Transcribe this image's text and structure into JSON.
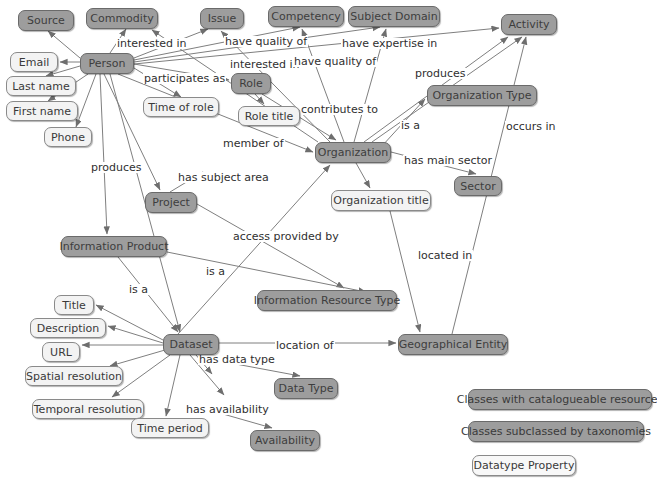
{
  "diagram": {
    "background_color": "#ffffff",
    "node_fill_dark": "#9d9d9d",
    "node_fill_light": "#f3f3f3",
    "edge_color": "#7a7a7a"
  },
  "nodes": [
    {
      "id": "source",
      "label": "Source",
      "style": "dark",
      "x": 18,
      "y": 10,
      "w": 56,
      "h": 21
    },
    {
      "id": "commodity",
      "label": "Commodity",
      "style": "dark",
      "x": 86,
      "y": 8,
      "w": 72,
      "h": 21
    },
    {
      "id": "issue",
      "label": "Issue",
      "style": "dark",
      "x": 200,
      "y": 8,
      "w": 44,
      "h": 21
    },
    {
      "id": "competency",
      "label": "Competency",
      "style": "dark",
      "x": 268,
      "y": 6,
      "w": 76,
      "h": 21
    },
    {
      "id": "subject_domain",
      "label": "Subject Domain",
      "style": "dark",
      "x": 348,
      "y": 6,
      "w": 92,
      "h": 21
    },
    {
      "id": "activity",
      "label": "Activity",
      "style": "dark",
      "x": 501,
      "y": 14,
      "w": 56,
      "h": 21
    },
    {
      "id": "email",
      "label": "Email",
      "style": "light",
      "x": 10,
      "y": 52,
      "w": 48,
      "h": 20
    },
    {
      "id": "person",
      "label": "Person",
      "style": "dark",
      "x": 80,
      "y": 53,
      "w": 54,
      "h": 21
    },
    {
      "id": "role",
      "label": "Role",
      "style": "dark",
      "x": 231,
      "y": 73,
      "w": 40,
      "h": 21
    },
    {
      "id": "last_name",
      "label": "Last name",
      "style": "light",
      "x": 6,
      "y": 76,
      "w": 70,
      "h": 20
    },
    {
      "id": "time_of_role",
      "label": "Time of role",
      "style": "light",
      "x": 143,
      "y": 97,
      "w": 76,
      "h": 20
    },
    {
      "id": "role_title",
      "label": "Role title",
      "style": "light",
      "x": 238,
      "y": 106,
      "w": 62,
      "h": 20
    },
    {
      "id": "org_type",
      "label": "Organization Type",
      "style": "dark",
      "x": 427,
      "y": 85,
      "w": 110,
      "h": 21
    },
    {
      "id": "first_name",
      "label": "First name",
      "style": "light",
      "x": 6,
      "y": 101,
      "w": 72,
      "h": 20
    },
    {
      "id": "phone",
      "label": "Phone",
      "style": "light",
      "x": 44,
      "y": 127,
      "w": 48,
      "h": 20
    },
    {
      "id": "organization",
      "label": "Organization",
      "style": "dark",
      "x": 315,
      "y": 142,
      "w": 76,
      "h": 21
    },
    {
      "id": "sector",
      "label": "Sector",
      "style": "dark",
      "x": 454,
      "y": 176,
      "w": 48,
      "h": 20
    },
    {
      "id": "project",
      "label": "Project",
      "style": "dark",
      "x": 145,
      "y": 192,
      "w": 52,
      "h": 21
    },
    {
      "id": "org_title",
      "label": "Organization title",
      "style": "light",
      "x": 331,
      "y": 190,
      "w": 100,
      "h": 21
    },
    {
      "id": "info_product",
      "label": "Information Product",
      "style": "dark",
      "x": 61,
      "y": 236,
      "w": 106,
      "h": 21
    },
    {
      "id": "info_res_type",
      "label": "Information Resource Type",
      "style": "dark",
      "x": 257,
      "y": 290,
      "w": 140,
      "h": 21
    },
    {
      "id": "title",
      "label": "Title",
      "style": "light",
      "x": 54,
      "y": 295,
      "w": 40,
      "h": 20
    },
    {
      "id": "description",
      "label": "Description",
      "style": "light",
      "x": 30,
      "y": 318,
      "w": 76,
      "h": 20
    },
    {
      "id": "dataset",
      "label": "Dataset",
      "style": "dark",
      "x": 163,
      "y": 334,
      "w": 56,
      "h": 21
    },
    {
      "id": "geo_entity",
      "label": "Geographical Entity",
      "style": "dark",
      "x": 398,
      "y": 334,
      "w": 110,
      "h": 21
    },
    {
      "id": "url",
      "label": "URL",
      "style": "light",
      "x": 42,
      "y": 342,
      "w": 38,
      "h": 20
    },
    {
      "id": "spatial_res",
      "label": "Spatial resolution",
      "style": "light",
      "x": 25,
      "y": 366,
      "w": 98,
      "h": 20
    },
    {
      "id": "data_type",
      "label": "Data Type",
      "style": "dark",
      "x": 274,
      "y": 378,
      "w": 64,
      "h": 21
    },
    {
      "id": "temporal_res",
      "label": "Temporal resolution",
      "style": "light",
      "x": 32,
      "y": 399,
      "w": 112,
      "h": 20
    },
    {
      "id": "time_period",
      "label": "Time period",
      "style": "light",
      "x": 131,
      "y": 418,
      "w": 78,
      "h": 20
    },
    {
      "id": "availability",
      "label": "Availability",
      "style": "dark",
      "x": 250,
      "y": 430,
      "w": 70,
      "h": 21
    }
  ],
  "edge_labels": [
    {
      "id": "interested-in-commodity",
      "text": "interested in",
      "x": 116,
      "y": 38
    },
    {
      "id": "have-quality-of-issue",
      "text": "have quality of",
      "x": 224,
      "y": 36
    },
    {
      "id": "have-expertise-in",
      "text": "have expertise in",
      "x": 341,
      "y": 38
    },
    {
      "id": "interested-in-issue",
      "text": "interested in",
      "x": 229,
      "y": 59
    },
    {
      "id": "have-quality-of-comp",
      "text": "have quality of",
      "x": 293,
      "y": 56
    },
    {
      "id": "participates-as",
      "text": "participates as",
      "x": 143,
      "y": 73
    },
    {
      "id": "produces-activity",
      "text": "produces",
      "x": 414,
      "y": 68
    },
    {
      "id": "contributes-to",
      "text": "contributes to",
      "x": 300,
      "y": 104
    },
    {
      "id": "is-a-orgtype",
      "text": "is a",
      "x": 400,
      "y": 120
    },
    {
      "id": "occurs-in",
      "text": "occurs in",
      "x": 505,
      "y": 121
    },
    {
      "id": "member-of",
      "text": "member of",
      "x": 222,
      "y": 138
    },
    {
      "id": "has-main-sector",
      "text": "has main sector",
      "x": 403,
      "y": 155
    },
    {
      "id": "produces-infoproduct",
      "text": "produces",
      "x": 90,
      "y": 162
    },
    {
      "id": "has-subject-area",
      "text": "has subject area",
      "x": 177,
      "y": 172
    },
    {
      "id": "access-provided-by",
      "text": "access provided by",
      "x": 232,
      "y": 231
    },
    {
      "id": "located-in",
      "text": "located in",
      "x": 417,
      "y": 250
    },
    {
      "id": "is-a-infores",
      "text": "is a",
      "x": 205,
      "y": 266
    },
    {
      "id": "is-a-dataset",
      "text": "is a",
      "x": 128,
      "y": 284
    },
    {
      "id": "location-of",
      "text": "location of",
      "x": 275,
      "y": 340
    },
    {
      "id": "has-data-type",
      "text": "has data type",
      "x": 198,
      "y": 354
    },
    {
      "id": "has-availability",
      "text": "has availability",
      "x": 185,
      "y": 404
    }
  ],
  "edges": [
    {
      "id": "person-source",
      "from": "Person",
      "to": "Source",
      "label": ""
    },
    {
      "id": "person-commodity",
      "from": "Person",
      "to": "Commodity",
      "label": "interested in"
    },
    {
      "id": "person-issue",
      "from": "Person",
      "to": "Issue",
      "label": "interested in"
    },
    {
      "id": "person-competency",
      "from": "Person",
      "to": "Competency",
      "label": "have quality of"
    },
    {
      "id": "person-subject-domain",
      "from": "Person",
      "to": "Subject Domain",
      "label": "have expertise in"
    },
    {
      "id": "person-activity",
      "from": "Person",
      "to": "Activity",
      "label": ""
    },
    {
      "id": "person-email",
      "from": "Person",
      "to": "Email",
      "label": ""
    },
    {
      "id": "person-last-name",
      "from": "Person",
      "to": "Last name",
      "label": ""
    },
    {
      "id": "person-first-name",
      "from": "Person",
      "to": "First name",
      "label": ""
    },
    {
      "id": "person-phone",
      "from": "Person",
      "to": "Phone",
      "label": ""
    },
    {
      "id": "person-role",
      "from": "Person",
      "to": "Role",
      "label": "participates as"
    },
    {
      "id": "person-time-of-role",
      "from": "Person",
      "to": "Time of role",
      "label": ""
    },
    {
      "id": "person-organization",
      "from": "Person",
      "to": "Organization",
      "label": "member of"
    },
    {
      "id": "person-info-product",
      "from": "Person",
      "to": "Information Product",
      "label": "produces"
    },
    {
      "id": "person-project",
      "from": "Person",
      "to": "Project",
      "label": "produces"
    },
    {
      "id": "person-dataset",
      "from": "Person",
      "to": "Dataset",
      "label": ""
    },
    {
      "id": "role-role-title",
      "from": "Role",
      "to": "Role title",
      "label": ""
    },
    {
      "id": "role-organization",
      "from": "Role",
      "to": "Organization",
      "label": ""
    },
    {
      "id": "organization-issue",
      "from": "Organization",
      "to": "Issue",
      "label": "interested in"
    },
    {
      "id": "organization-commodity",
      "from": "Organization",
      "to": "Commodity",
      "label": "interested in"
    },
    {
      "id": "organization-competency",
      "from": "Organization",
      "to": "Competency",
      "label": "have quality of"
    },
    {
      "id": "organization-subject-domain",
      "from": "Organization",
      "to": "Subject Domain",
      "label": ""
    },
    {
      "id": "organization-activity",
      "from": "Organization",
      "to": "Activity",
      "label": "contributes to"
    },
    {
      "id": "organization-activity-prod",
      "from": "Organization",
      "to": "Activity",
      "label": "produces"
    },
    {
      "id": "organization-org-type",
      "from": "Organization",
      "to": "Organization Type",
      "label": "is a"
    },
    {
      "id": "organization-sector",
      "from": "Organization",
      "to": "Sector",
      "label": "has main sector"
    },
    {
      "id": "organization-org-title",
      "from": "Organization",
      "to": "Organization title",
      "label": ""
    },
    {
      "id": "organization-geo-entity",
      "from": "Organization title",
      "to": "Geographical Entity",
      "label": "located in"
    },
    {
      "id": "project-subject-area",
      "from": "Project",
      "to": "Subject Domain",
      "label": "has subject area"
    },
    {
      "id": "project-access-provided",
      "from": "Project",
      "to": "Information Resource Type",
      "label": "access provided by"
    },
    {
      "id": "info-product-info-res",
      "from": "Information Product",
      "to": "Information Resource Type",
      "label": "is a"
    },
    {
      "id": "info-product-dataset",
      "from": "Information Product",
      "to": "Dataset",
      "label": "is a"
    },
    {
      "id": "dataset-organization",
      "from": "Dataset",
      "to": "Organization",
      "label": "access provided by"
    },
    {
      "id": "dataset-title",
      "from": "Dataset",
      "to": "Title",
      "label": ""
    },
    {
      "id": "dataset-description",
      "from": "Dataset",
      "to": "Description",
      "label": ""
    },
    {
      "id": "dataset-url",
      "from": "Dataset",
      "to": "URL",
      "label": ""
    },
    {
      "id": "dataset-spatial-res",
      "from": "Dataset",
      "to": "Spatial resolution",
      "label": ""
    },
    {
      "id": "dataset-temporal-res",
      "from": "Dataset",
      "to": "Temporal resolution",
      "label": ""
    },
    {
      "id": "dataset-time-period",
      "from": "Dataset",
      "to": "Time period",
      "label": ""
    },
    {
      "id": "dataset-data-type",
      "from": "Dataset",
      "to": "Data Type",
      "label": "has data type"
    },
    {
      "id": "dataset-availability",
      "from": "Dataset",
      "to": "Availability",
      "label": "has availability"
    },
    {
      "id": "dataset-geo-entity",
      "from": "Dataset",
      "to": "Geographical Entity",
      "label": "location of"
    },
    {
      "id": "geo-entity-activity",
      "from": "Geographical Entity",
      "to": "Activity",
      "label": "occurs in"
    }
  ],
  "legend": {
    "items": [
      {
        "id": "legend-catalogueable",
        "label": "Classes with catalogueable resources",
        "style": "dark",
        "x": 468,
        "y": 389,
        "w": 184,
        "h": 21
      },
      {
        "id": "legend-taxonomies",
        "label": "Classes subclassed by taxonomies",
        "style": "dark",
        "x": 468,
        "y": 421,
        "w": 176,
        "h": 21
      },
      {
        "id": "legend-datatype",
        "label": "Datatype Property",
        "style": "light",
        "x": 472,
        "y": 455,
        "w": 104,
        "h": 21
      }
    ]
  }
}
